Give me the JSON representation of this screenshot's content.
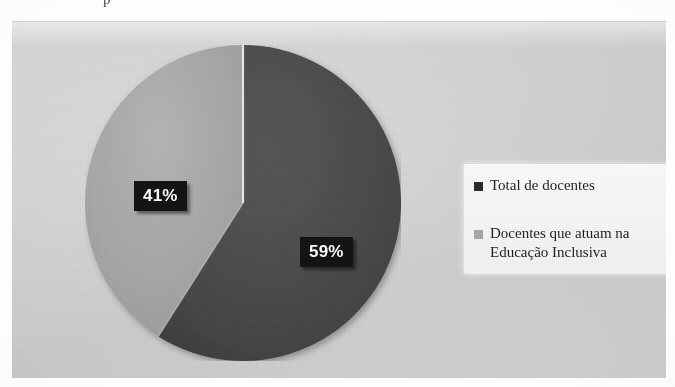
{
  "page": {
    "clipped_text_fragment": "p"
  },
  "chart_data": {
    "type": "pie",
    "title": "",
    "subtitle": "",
    "xlabel": "",
    "ylabel": "",
    "grid": false,
    "legend_position": "right",
    "categories": [
      "Total de docentes",
      "Docentes que atuam na Educação Inclusiva"
    ],
    "values": [
      59,
      41
    ],
    "value_unit": "%",
    "data_labels": [
      "59%",
      "41%"
    ],
    "colors": [
      "#4a4a4a",
      "#a8a8a8"
    ],
    "start_angle_deg": 0,
    "direction": "clockwise",
    "slices": [
      {
        "label": "Total de docentes",
        "value": 59,
        "display": "59%",
        "color": "#4a4a4a",
        "start_angle_deg": 0,
        "sweep_angle_deg": 212.4
      },
      {
        "label": "Docentes que atuam na Educação Inclusiva",
        "value": 41,
        "display": "41%",
        "color": "#a8a8a8",
        "start_angle_deg": 212.4,
        "sweep_angle_deg": 147.6
      }
    ]
  },
  "labels": {
    "light_slice": "41%",
    "dark_slice": "59%"
  },
  "legend": {
    "items": [
      {
        "label": "Total de docentes",
        "color": "#2b2b2b"
      },
      {
        "label": "Docentes que atuam na Educação Inclusiva",
        "color": "#a8a8a8"
      }
    ]
  },
  "theme": {
    "plot_background": "#d2d2d2",
    "page_background": "#fdfdfd",
    "legend_background": "#f7f7f6",
    "label_box_background": "#141414",
    "label_text_color": "#ffffff",
    "dark_slice_color": "#4a4a4a",
    "light_slice_color": "#a8a8a8"
  }
}
